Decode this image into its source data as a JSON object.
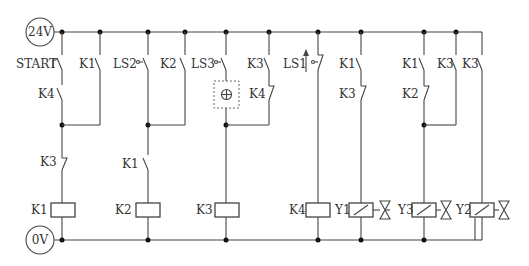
{
  "diagram": {
    "type": "electrical ladder diagram",
    "supply": {
      "positive": "24V",
      "negative": "0V"
    },
    "rungs": [
      {
        "id": 1,
        "branches": [
          {
            "contacts": [
              {
                "label": "START",
                "type": "pushbutton-NO"
              },
              {
                "label": "K4",
                "type": "NO"
              }
            ]
          },
          {
            "contacts": [
              {
                "label": "K1",
                "type": "NO"
              }
            ]
          }
        ],
        "series": [
          {
            "label": "K3",
            "type": "NC"
          }
        ],
        "coil": {
          "label": "K1",
          "type": "relay"
        }
      },
      {
        "id": 2,
        "branches": [
          {
            "contacts": [
              {
                "label": "LS2",
                "type": "limit-NO"
              }
            ]
          },
          {
            "contacts": [
              {
                "label": "K2",
                "type": "NO"
              }
            ]
          }
        ],
        "series": [
          {
            "label": "K1",
            "type": "NO"
          }
        ],
        "coil": {
          "label": "K2",
          "type": "relay"
        }
      },
      {
        "id": 3,
        "branches": [
          {
            "contacts": [
              {
                "label": "LS3",
                "type": "limit-NO"
              },
              {
                "label": "",
                "type": "timer-box"
              }
            ]
          },
          {
            "contacts": [
              {
                "label": "K3",
                "type": "NO"
              },
              {
                "label": "K4",
                "type": "NC"
              }
            ]
          }
        ],
        "series": [],
        "coil": {
          "label": "K3",
          "type": "relay"
        }
      },
      {
        "id": 4,
        "contacts": [
          {
            "label": "LS1",
            "type": "limit-NC-actuated"
          }
        ],
        "coil": {
          "label": "K4",
          "type": "relay"
        }
      },
      {
        "id": 5,
        "contacts": [
          {
            "label": "K1",
            "type": "NO"
          },
          {
            "label": "K3",
            "type": "NC"
          }
        ],
        "coil": {
          "label": "Y1",
          "type": "solenoid-valve"
        }
      },
      {
        "id": 6,
        "branches": [
          {
            "contacts": [
              {
                "label": "K1",
                "type": "NO"
              },
              {
                "label": "K2",
                "type": "NC"
              }
            ]
          },
          {
            "contacts": [
              {
                "label": "K3",
                "type": "NO"
              }
            ]
          }
        ],
        "coil": {
          "label": "Y3",
          "type": "solenoid-valve"
        }
      },
      {
        "id": 7,
        "contacts": [
          {
            "label": "K3",
            "type": "NO"
          }
        ],
        "coil": {
          "label": "Y2",
          "type": "solenoid-valve"
        }
      }
    ]
  },
  "labels": {
    "supply_top": "24V",
    "supply_bottom": "0V",
    "start": "START",
    "r1_k4": "K4",
    "r1_k1": "K1",
    "r1_k3": "K3",
    "r1_coil": "K1",
    "r2_ls2": "LS2",
    "r2_k2": "K2",
    "r2_k1": "K1",
    "r2_coil": "K2",
    "r3_ls3": "LS3",
    "r3_k3": "K3",
    "r3_k4": "K4",
    "r3_coil": "K3",
    "r4_ls1": "LS1",
    "r4_coil": "K4",
    "r5_k1": "K1",
    "r5_k3": "K3",
    "r5_coil": "Y1",
    "r6_k1": "K1",
    "r6_k2": "K2",
    "r6_k3": "K3",
    "r6_coil": "Y3",
    "r7_k3": "K3",
    "r7_coil": "Y2"
  }
}
